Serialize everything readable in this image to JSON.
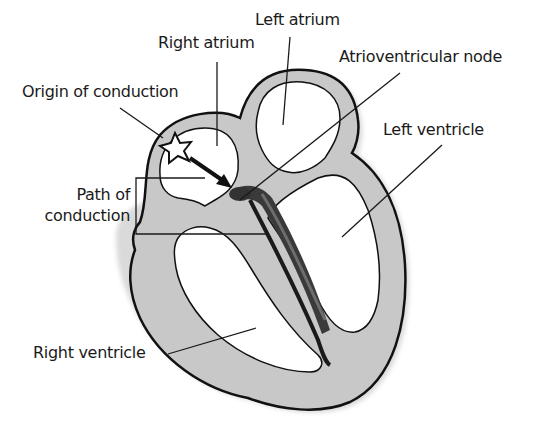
{
  "diagram": {
    "colors": {
      "wall_fill": "#c8c8c8",
      "outline": "#111111",
      "chamber_fill": "#ffffff",
      "conduction_path": "#3a3a3a",
      "leader_line": "#1a1a1a"
    },
    "labels": {
      "left_atrium": "Left atrium",
      "right_atrium": "Right atrium",
      "av_node": "Atrioventricular node",
      "origin": "Origin of conduction",
      "left_ventricle": "Left ventricle",
      "path_line1": "Path of",
      "path_line2": "conduction",
      "right_ventricle": "Right ventricle"
    },
    "icons": {
      "origin_marker": "star-icon",
      "conduction_arrow": "arrow-icon"
    }
  }
}
